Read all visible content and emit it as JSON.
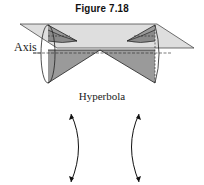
{
  "figure": {
    "title": "Figure 7.18",
    "axis_label": "Axis",
    "curve_label": "Hyperbola"
  },
  "colors": {
    "cone_fill": "#9a9a9a",
    "plane_fill": "#d8d8d8",
    "stroke": "#222222",
    "background": "#ffffff"
  }
}
